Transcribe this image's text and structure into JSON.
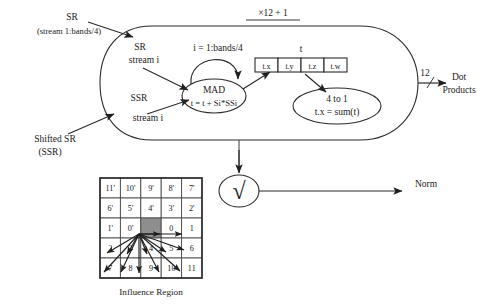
{
  "figure": {
    "caption": "Influence Region",
    "top_label": "×12 + 1"
  },
  "inputs": {
    "sr_label": "SR",
    "sr_sub": "(stream 1:bands/4)",
    "sr_inner_line1": "SR",
    "sr_inner_line2": "stream i",
    "ssr_inner_line1": "SSR",
    "ssr_inner_line2": "stream i",
    "shifted_label_line1": "Shifted SR",
    "shifted_label_line2": "(SSR)"
  },
  "mad": {
    "loop_label": "i = 1:bands/4",
    "title": "MAD",
    "formula": "t = t + Si*SSi"
  },
  "accumulator": {
    "vector_label": "t",
    "components": [
      "t.x",
      "t.y",
      "t.z",
      "t.w"
    ]
  },
  "reduce": {
    "title": "4 to 1",
    "formula": "t.x = sum(t)"
  },
  "outputs": {
    "bus_width": "12",
    "dot_products_line1": "Dot",
    "dot_products_line2": "Products",
    "sqrt_symbol": "√",
    "norm_label": "Norm"
  },
  "influence_region": {
    "rows": [
      [
        "11'",
        "10'",
        "9'",
        "8'",
        "7'"
      ],
      [
        "6'",
        "5'",
        "4'",
        "3'",
        "2'"
      ],
      [
        "1'",
        "0'",
        "",
        "0",
        "1"
      ],
      [
        "2",
        "3",
        "4",
        "5",
        "6"
      ],
      [
        "7",
        "8",
        "9",
        "10",
        "11"
      ]
    ],
    "center": {
      "row": 2,
      "col": 2
    }
  },
  "colors": {
    "ink": "#1a1a1a",
    "stroke": "#2b2b2b",
    "shade": "#8e8e8e",
    "paper": "#ffffff"
  }
}
